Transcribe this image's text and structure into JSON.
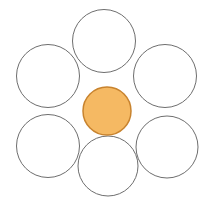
{
  "figure": {
    "name": "hexagonal-circle-packing",
    "canvas": {
      "width": 214,
      "height": 201,
      "background_color": "#ffffff"
    },
    "palette": {
      "background": "#ffffff",
      "satellite_fill": "#ffffff",
      "satellite_stroke": "#6e6e6e",
      "center_fill": "#f5b963",
      "center_stroke": "#c8832e"
    },
    "stroke_widths": {
      "satellite": 1,
      "center": 1.5
    },
    "counts": {
      "satellite_circles": 6,
      "center_circles": 1,
      "total_circles": 7
    }
  },
  "chart_data": {
    "type": "scatter",
    "xlabel": "",
    "ylabel": "",
    "xlim": [
      0,
      214
    ],
    "ylim": [
      0,
      201
    ],
    "grid": false,
    "legend": "none",
    "series": [
      {
        "name": "satellite-circles",
        "fill": "#ffffff",
        "stroke": "#6e6e6e",
        "stroke_width": 1,
        "points": [
          {
            "label": "top",
            "cx": 104,
            "cy": 41,
            "r": 31.5
          },
          {
            "label": "upper-left",
            "cx": 48,
            "cy": 76,
            "r": 31.5
          },
          {
            "label": "upper-right",
            "cx": 165,
            "cy": 76,
            "r": 31.5
          },
          {
            "label": "lower-left",
            "cx": 48,
            "cy": 146,
            "r": 31.5
          },
          {
            "label": "lower-right",
            "cx": 167,
            "cy": 147,
            "r": 31.0
          },
          {
            "label": "bottom",
            "cx": 108,
            "cy": 166,
            "r": 30.0
          }
        ]
      },
      {
        "name": "center-circle",
        "fill": "#f5b963",
        "stroke": "#c8832e",
        "stroke_width": 1.5,
        "points": [
          {
            "label": "center",
            "cx": 107,
            "cy": 111,
            "r": 24.0
          }
        ]
      }
    ]
  }
}
